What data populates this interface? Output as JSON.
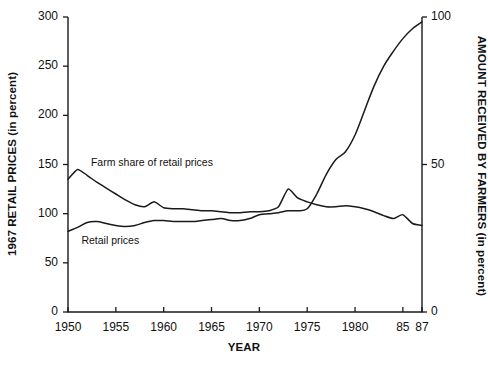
{
  "chart_data": {
    "type": "line",
    "title": "",
    "xlabel": "YEAR",
    "ylabel": "1967 RETAIL PRICES (in percent)",
    "ylabel_right": "AMOUNT RECEIVED BY FARMERS (in percent)",
    "xlim": [
      1950,
      1987
    ],
    "ylim": [
      0,
      300
    ],
    "ylim_right": [
      0,
      100
    ],
    "grid": false,
    "legend_position": "inline-annotation",
    "x_ticks": [
      {
        "value": 1950,
        "label": "1950"
      },
      {
        "value": 1955,
        "label": "1955"
      },
      {
        "value": 1960,
        "label": "1960"
      },
      {
        "value": 1965,
        "label": "1965"
      },
      {
        "value": 1970,
        "label": "1970"
      },
      {
        "value": 1975,
        "label": "1975"
      },
      {
        "value": 1980,
        "label": "1980"
      },
      {
        "value": 1985,
        "label": "85"
      },
      {
        "value": 1987,
        "label": "87"
      }
    ],
    "y_ticks_left": [
      {
        "value": 0,
        "label": "0"
      },
      {
        "value": 50,
        "label": "50"
      },
      {
        "value": 100,
        "label": "100"
      },
      {
        "value": 150,
        "label": "150"
      },
      {
        "value": 200,
        "label": "200"
      },
      {
        "value": 250,
        "label": "250"
      },
      {
        "value": 300,
        "label": "300"
      }
    ],
    "y_ticks_right": [
      {
        "value": 0,
        "label": "0"
      },
      {
        "value": 50,
        "label": "50"
      },
      {
        "value": 100,
        "label": "100"
      }
    ],
    "x": [
      1950,
      1951,
      1952,
      1953,
      1954,
      1955,
      1956,
      1957,
      1958,
      1959,
      1960,
      1961,
      1962,
      1963,
      1964,
      1965,
      1966,
      1967,
      1968,
      1969,
      1970,
      1971,
      1972,
      1973,
      1974,
      1975,
      1976,
      1977,
      1978,
      1979,
      1980,
      1981,
      1982,
      1983,
      1984,
      1985,
      1986,
      1987
    ],
    "series": [
      {
        "name": "Farm share of retail prices",
        "label": "Farm share of retail prices",
        "axis": "left",
        "values": [
          135,
          145,
          139,
          132,
          126,
          120,
          114,
          109,
          107,
          112,
          106,
          105,
          105,
          104,
          103,
          103,
          102,
          101,
          101,
          102,
          102,
          103,
          107,
          125,
          116,
          112,
          109,
          107,
          107,
          108,
          107,
          105,
          102,
          98,
          95,
          99,
          90,
          88
        ]
      },
      {
        "name": "Retail prices",
        "label": "Retail prices",
        "axis": "left",
        "values": [
          82,
          86,
          91,
          92,
          90,
          88,
          87,
          88,
          91,
          93,
          93,
          92,
          92,
          92,
          93,
          94,
          95,
          93,
          93,
          95,
          99,
          100,
          101,
          103,
          103,
          105,
          120,
          140,
          155,
          163,
          180,
          205,
          230,
          250,
          265,
          278,
          288,
          295
        ]
      }
    ],
    "annotations": [
      {
        "text": "Farm share of retail prices",
        "x": 1952.4,
        "y": 152
      },
      {
        "text": "Retail prices",
        "x": 1951.4,
        "y": 72
      }
    ]
  },
  "colors": {
    "line": "#1a1a1a",
    "axis": "#1a1a1a",
    "background": "#ffffff"
  }
}
